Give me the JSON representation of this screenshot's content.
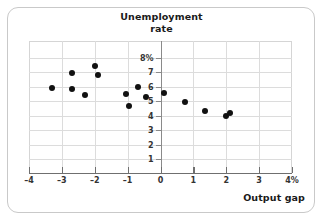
{
  "chart_data": {
    "type": "scatter",
    "title": "Unemployment rate",
    "title_line1": "Unemployment",
    "title_line2": "rate",
    "xlabel": "Output gap",
    "ylabel": "Unemployment rate",
    "xlim": [
      -4,
      4
    ],
    "ylim": [
      0,
      8.6
    ],
    "grid": true,
    "legend": "none",
    "x_tick_labels": [
      "–4",
      "–3",
      "–2",
      "–1",
      "0",
      "1",
      "2",
      "3",
      "4%"
    ],
    "x_tick_values": [
      -4,
      -3,
      -2,
      -1,
      0,
      1,
      2,
      3,
      4
    ],
    "y_tick_labels": [
      "8%",
      "7",
      "6",
      "5",
      "4",
      "3",
      "2",
      "1"
    ],
    "y_tick_values": [
      8,
      7,
      6,
      5,
      4,
      3,
      2,
      1
    ],
    "points": [
      {
        "x": -3.3,
        "y": 5.9
      },
      {
        "x": -2.7,
        "y": 6.9
      },
      {
        "x": -2.7,
        "y": 5.8
      },
      {
        "x": -2.3,
        "y": 5.4
      },
      {
        "x": -2.0,
        "y": 7.4
      },
      {
        "x": -1.9,
        "y": 6.8
      },
      {
        "x": -1.05,
        "y": 5.5
      },
      {
        "x": -0.95,
        "y": 4.65
      },
      {
        "x": -0.7,
        "y": 6.0
      },
      {
        "x": -0.45,
        "y": 5.3
      },
      {
        "x": 0.1,
        "y": 5.55
      },
      {
        "x": 0.75,
        "y": 4.9
      },
      {
        "x": 1.35,
        "y": 4.3
      },
      {
        "x": 2.0,
        "y": 4.0
      },
      {
        "x": 2.1,
        "y": 4.2
      }
    ],
    "colors": {
      "point": "#111111",
      "grid": "#dcdcdc",
      "axis": "#6f6f6f",
      "text": "#1a1a1a",
      "background": "#ffffff",
      "frame": "#c9c9c9"
    }
  }
}
